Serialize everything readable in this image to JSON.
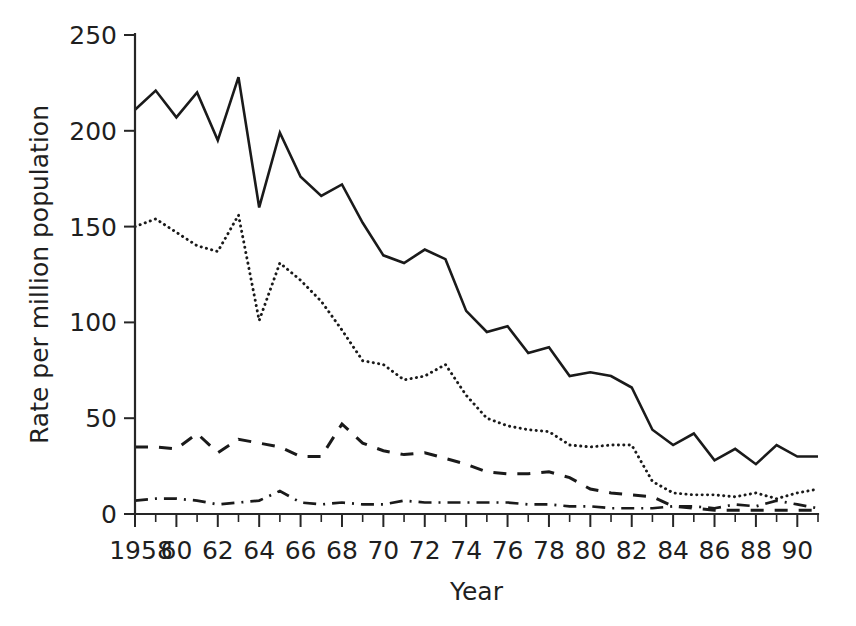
{
  "chart_data": {
    "type": "line",
    "title": "",
    "xlabel": "Year",
    "ylabel": "Rate per million population",
    "xlim": [
      1958,
      1991
    ],
    "ylim": [
      0,
      250
    ],
    "grid": false,
    "legend": "none",
    "y_ticks": [
      0,
      50,
      100,
      150,
      200,
      250
    ],
    "y_tick_labels": [
      "0",
      "50",
      "100",
      "150",
      "200",
      "250"
    ],
    "x_ticks": [
      1958,
      1960,
      1962,
      1964,
      1966,
      1968,
      1970,
      1972,
      1974,
      1976,
      1978,
      1980,
      1982,
      1984,
      1986,
      1988,
      1990
    ],
    "x_tick_labels": [
      "1958",
      "60",
      "62",
      "64",
      "66",
      "68",
      "70",
      "72",
      "74",
      "76",
      "78",
      "80",
      "82",
      "84",
      "86",
      "88",
      "90"
    ],
    "x_minor_tick_interval": 1,
    "x": [
      1958,
      1959,
      1960,
      1961,
      1962,
      1963,
      1964,
      1965,
      1966,
      1967,
      1968,
      1969,
      1970,
      1971,
      1972,
      1973,
      1974,
      1975,
      1976,
      1977,
      1978,
      1979,
      1980,
      1981,
      1982,
      1983,
      1984,
      1985,
      1986,
      1987,
      1988,
      1989,
      1990,
      1991
    ],
    "series": [
      {
        "name": "series-solid",
        "style": "solid",
        "color": "#1a1a1a",
        "values": [
          211,
          221,
          207,
          220,
          195,
          228,
          160,
          199,
          176,
          166,
          172,
          152,
          135,
          131,
          138,
          133,
          106,
          95,
          98,
          84,
          87,
          72,
          74,
          72,
          66,
          44,
          36,
          42,
          28,
          34,
          26,
          36,
          30,
          30
        ]
      },
      {
        "name": "series-dotted",
        "style": "dotted",
        "color": "#1a1a1a",
        "values": [
          150,
          154,
          147,
          140,
          137,
          156,
          101,
          131,
          122,
          111,
          96,
          80,
          78,
          70,
          72,
          78,
          62,
          50,
          46,
          44,
          43,
          36,
          35,
          36,
          36,
          17,
          11,
          10,
          10,
          9,
          11,
          8,
          11,
          13
        ]
      },
      {
        "name": "series-dashed",
        "style": "dashed",
        "color": "#1a1a1a",
        "values": [
          35,
          35,
          34,
          42,
          32,
          39,
          37,
          35,
          30,
          30,
          47,
          37,
          33,
          31,
          32,
          29,
          26,
          22,
          21,
          21,
          22,
          19,
          13,
          11,
          10,
          9,
          4,
          3,
          2,
          2,
          2,
          2,
          2,
          2
        ]
      },
      {
        "name": "series-dash-dot",
        "style": "dash-dot",
        "color": "#1a1a1a",
        "values": [
          7,
          8,
          8,
          7,
          5,
          6,
          7,
          12,
          6,
          5,
          6,
          5,
          5,
          7,
          6,
          6,
          6,
          6,
          6,
          5,
          5,
          4,
          4,
          3,
          3,
          3,
          4,
          4,
          3,
          5,
          4,
          7,
          5,
          3
        ]
      }
    ]
  }
}
